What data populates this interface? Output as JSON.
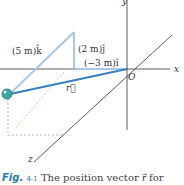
{
  "diagram": {
    "axes": {
      "x": "x",
      "y": "y",
      "z": "z",
      "origin": "O"
    },
    "components": {
      "k": "(5 m)k̂",
      "j": "(2 m)ĵ",
      "i": "(−3 m)î"
    },
    "vector_label": "r⃗",
    "colors": {
      "vector": "#3a7fc0",
      "components": "#a8c8e8",
      "particle": "#3aa8a0",
      "axes": "#333333"
    }
  },
  "caption": {
    "fig_label": "Fig.",
    "fig_number": "4-1",
    "text": "The position vector r⃗ for"
  }
}
